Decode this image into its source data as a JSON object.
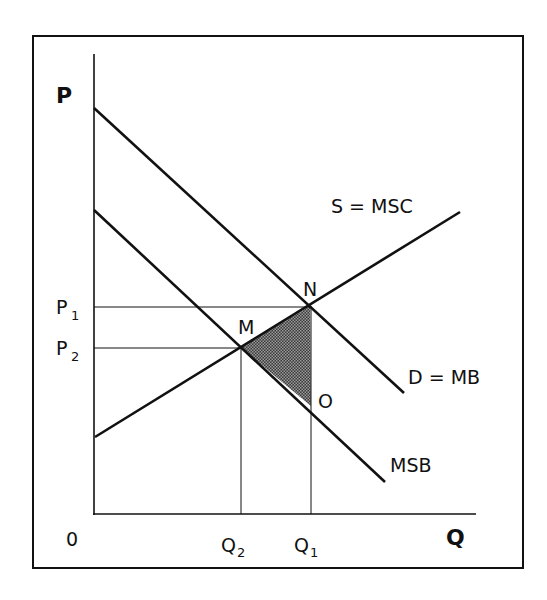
{
  "diagram": {
    "type": "externality-supply-demand",
    "axes": {
      "y_label": "P",
      "x_label": "Q",
      "origin_label": "0"
    },
    "price_ticks": [
      {
        "label": "P",
        "sub": "1",
        "y": 307
      },
      {
        "label": "P",
        "sub": "2",
        "y": 348
      }
    ],
    "quantity_ticks": [
      {
        "label": "Q",
        "sub": "2",
        "x": 241
      },
      {
        "label": "Q",
        "sub": "1",
        "x": 310
      }
    ],
    "curves": [
      {
        "name": "S = MSC",
        "from": [
          95,
          437
        ],
        "to": [
          460,
          212
        ]
      },
      {
        "name": "D = MB",
        "from": [
          94,
          108
        ],
        "to": [
          404,
          393
        ]
      },
      {
        "name": "MSB",
        "from": [
          94,
          210
        ],
        "to": [
          385,
          482
        ]
      }
    ],
    "points": [
      {
        "label": "N",
        "x": 310,
        "y": 306
      },
      {
        "label": "M",
        "x": 241,
        "y": 348
      },
      {
        "label": "O",
        "x": 311,
        "y": 406
      }
    ],
    "shaded_region": "triangle MNO (deadweight loss)",
    "colors": {
      "line": "#111111",
      "background": "#ffffff",
      "shade": "#555555"
    }
  }
}
